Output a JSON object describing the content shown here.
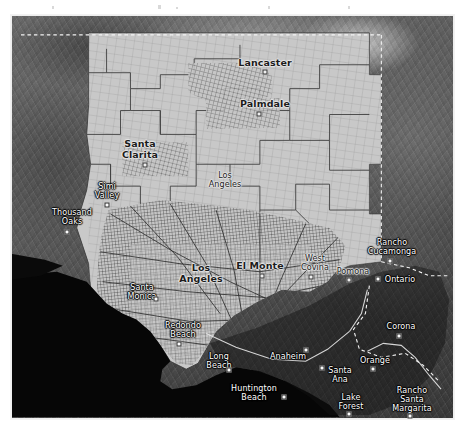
{
  "map": {
    "title": "Los Angeles County census tract boundaries over grayscale satellite basemap",
    "basemap_style": "satellite-grayscale",
    "overlay": "census-tract-polygons",
    "colors": {
      "tract_fill": "#c9c9c9",
      "tract_stroke": "#4a4a4a",
      "ocean": "#050505",
      "terrain_light": "#8e8e8e",
      "terrain_dark": "#3a3a3a",
      "county_boundary": "#f0f0f0",
      "label_light": "#ffffff",
      "label_dark": "#1c1c1c",
      "page_background": "#ffffff"
    },
    "frame": {
      "x": 10,
      "y": 14,
      "width": 445,
      "height": 406
    },
    "place_labels": [
      {
        "name": "Lancaster",
        "x": 264,
        "y": 62,
        "tone": "dark",
        "size": "big",
        "marker": true,
        "marker_dx": 0,
        "marker_dy": 9
      },
      {
        "name": "Palmdale",
        "x": 264,
        "y": 103,
        "tone": "dark",
        "size": "big",
        "marker": true,
        "marker_dx": -6,
        "marker_dy": 10
      },
      {
        "name": "Santa\nClarita",
        "x": 139,
        "y": 148,
        "tone": "dark",
        "size": "big",
        "marker": true,
        "marker_dx": 5,
        "marker_dy": 16
      },
      {
        "name": "Los\nAngeles",
        "x": 224,
        "y": 179,
        "tone": "dark",
        "size": "normal",
        "marker": false,
        "marker_dx": 0,
        "marker_dy": 0
      },
      {
        "name": "Simi\nValley",
        "x": 106,
        "y": 190,
        "tone": "light",
        "size": "normal",
        "marker": true,
        "marker_dx": 0,
        "marker_dy": 14
      },
      {
        "name": "Thousand\nOaks",
        "x": 71,
        "y": 216,
        "tone": "light",
        "size": "normal",
        "marker": true,
        "marker_dx": -5,
        "marker_dy": 15
      },
      {
        "name": "Rancho\nCucamonga",
        "x": 391,
        "y": 246,
        "tone": "light",
        "size": "normal",
        "marker": true,
        "marker_dx": -2,
        "marker_dy": 14
      },
      {
        "name": "Los\nAngeles",
        "x": 200,
        "y": 272,
        "tone": "dark",
        "size": "big",
        "marker": false,
        "marker_dx": 0,
        "marker_dy": 0
      },
      {
        "name": "El Monte",
        "x": 259,
        "y": 265,
        "tone": "dark",
        "size": "big",
        "marker": true,
        "marker_dx": 2,
        "marker_dy": 10
      },
      {
        "name": "West\nCovina",
        "x": 314,
        "y": 262,
        "tone": "dark",
        "size": "normal",
        "marker": true,
        "marker_dx": -4,
        "marker_dy": 14
      },
      {
        "name": "Pomona",
        "x": 352,
        "y": 270,
        "tone": "dark",
        "size": "normal",
        "marker": true,
        "marker_dx": -4,
        "marker_dy": 9
      },
      {
        "name": "Ontario",
        "x": 399,
        "y": 278,
        "tone": "light",
        "size": "normal",
        "marker": true,
        "marker_dx": -22,
        "marker_dy": 0
      },
      {
        "name": "Santa\nMonica",
        "x": 141,
        "y": 291,
        "tone": "light",
        "size": "normal",
        "marker": true,
        "marker_dx": 14,
        "marker_dy": 7
      },
      {
        "name": "Corona",
        "x": 400,
        "y": 325,
        "tone": "light",
        "size": "normal",
        "marker": true,
        "marker_dx": -2,
        "marker_dy": 10
      },
      {
        "name": "Redondo\nBeach",
        "x": 182,
        "y": 329,
        "tone": "light",
        "size": "normal",
        "marker": true,
        "marker_dx": -4,
        "marker_dy": 14
      },
      {
        "name": "Long\nBeach",
        "x": 218,
        "y": 360,
        "tone": "light",
        "size": "normal",
        "marker": true,
        "marker_dx": 10,
        "marker_dy": 9
      },
      {
        "name": "Anaheim",
        "x": 287,
        "y": 355,
        "tone": "light",
        "size": "normal",
        "marker": true,
        "marker_dx": 18,
        "marker_dy": -6
      },
      {
        "name": "Orange",
        "x": 374,
        "y": 359,
        "tone": "light",
        "size": "normal",
        "marker": true,
        "marker_dx": -2,
        "marker_dy": 9
      },
      {
        "name": "Santa\nAna",
        "x": 339,
        "y": 374,
        "tone": "light",
        "size": "normal",
        "marker": true,
        "marker_dx": -18,
        "marker_dy": -7
      },
      {
        "name": "Huntington\nBeach",
        "x": 253,
        "y": 392,
        "tone": "light",
        "size": "normal",
        "marker": true,
        "marker_dx": 30,
        "marker_dy": 4
      },
      {
        "name": "Lake\nForest",
        "x": 350,
        "y": 401,
        "tone": "light",
        "size": "normal",
        "marker": true,
        "marker_dx": -2,
        "marker_dy": 12
      },
      {
        "name": "Rancho\nSanta\nMargarita",
        "x": 411,
        "y": 398,
        "tone": "light",
        "size": "normal",
        "marker": true,
        "marker_dx": -2,
        "marker_dy": 17
      }
    ]
  }
}
